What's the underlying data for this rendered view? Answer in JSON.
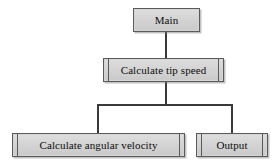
{
  "diagram": {
    "type": "structure-chart",
    "background_color": "#ffffff",
    "node_fill_color": "#d6d6d6",
    "node_border_color": "#5a5a5a",
    "connector_color": "#3a3a3a",
    "text_color": "#0d0d0d",
    "nodes": [
      {
        "id": "main",
        "label": "Main",
        "level": 0,
        "style": "plain",
        "x": 133,
        "y": 8,
        "width": 67,
        "height": 24
      },
      {
        "id": "tip_speed",
        "label": "Calculate tip speed",
        "level": 1,
        "style": "library-module",
        "x": 103,
        "y": 58,
        "width": 121,
        "height": 24
      },
      {
        "id": "angular_velocity",
        "label": "Calculate angular velocity",
        "level": 2,
        "style": "library-module",
        "x": 12,
        "y": 133,
        "width": 173,
        "height": 24
      },
      {
        "id": "output",
        "label": "Output",
        "level": 2,
        "style": "library-module",
        "x": 196,
        "y": 133,
        "width": 72,
        "height": 24
      }
    ],
    "edges": [
      {
        "id": "main_to_tip_speed",
        "from": "main",
        "to": "tip_speed"
      },
      {
        "id": "tip_speed_to_angular_velocity",
        "from": "tip_speed",
        "to": "angular_velocity"
      },
      {
        "id": "tip_speed_to_output",
        "from": "tip_speed",
        "to": "output"
      }
    ]
  }
}
